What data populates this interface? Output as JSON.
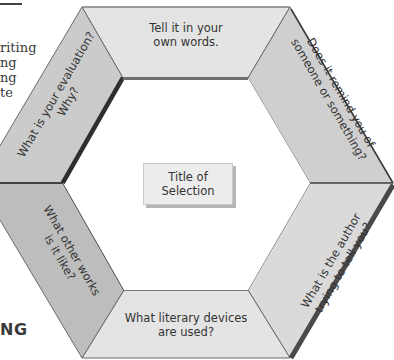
{
  "background": {
    "left_text_lines": [
      "riting",
      "ng",
      "ng",
      "te"
    ],
    "heading_fragment": "NG"
  },
  "diagram": {
    "center": {
      "line1": "Title of",
      "line2": "Selection"
    },
    "segments": [
      {
        "id": "top",
        "line1": "Tell it in your",
        "line2": "own words."
      },
      {
        "id": "upper-right",
        "line1": "Does it remind you of",
        "line2": "someone or something?"
      },
      {
        "id": "lower-right",
        "line1": "What is the author",
        "line2": "trying to tell you?"
      },
      {
        "id": "bottom",
        "line1": "What literary devices",
        "line2": "are used?"
      },
      {
        "id": "lower-left",
        "line1": "What other works",
        "line2": "is it like?"
      },
      {
        "id": "upper-left",
        "line1": "What is your evaluation?",
        "line2": "Why?"
      }
    ],
    "colors": {
      "segment_light": "#e2e2e2",
      "segment_mid": "#d0d0d0",
      "segment_dark": "#bdbdbd",
      "edge_shadow": "#3c3c3c",
      "outline": "#555555",
      "center_fill": "#ececec"
    }
  }
}
